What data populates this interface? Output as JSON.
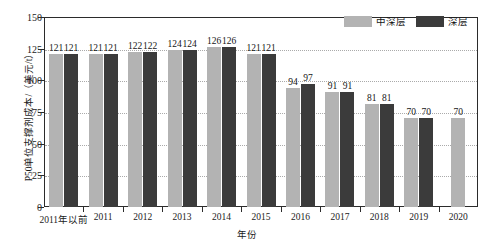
{
  "chart_data": {
    "type": "bar",
    "title": "",
    "xlabel": "年份",
    "ylabel": "P50单位支撑剂成本/（美元/t）",
    "ylim": [
      0,
      150
    ],
    "yticks": [
      0,
      25,
      50,
      75,
      100,
      125,
      150
    ],
    "grid": true,
    "legend_position": "top-right",
    "categories": [
      "2011年以前",
      "2011",
      "2012",
      "2013",
      "2014",
      "2015",
      "2016",
      "2017",
      "2018",
      "2019",
      "2020"
    ],
    "series": [
      {
        "name": "中深层",
        "color": "#b3b3b3",
        "values": [
          121,
          121,
          122,
          124,
          126,
          121,
          94,
          91,
          81,
          70,
          70
        ]
      },
      {
        "name": "深层",
        "color": "#3b3b3b",
        "values": [
          121,
          121,
          122,
          124,
          126,
          121,
          97,
          91,
          81,
          70,
          null
        ]
      }
    ]
  },
  "legend": {
    "items": [
      {
        "label": "中深层",
        "swatch": "light"
      },
      {
        "label": "深层",
        "swatch": "dark"
      }
    ]
  },
  "axes": {
    "y_title": "P50单位支撑剂成本/（美元/t）",
    "x_title": "年份"
  }
}
